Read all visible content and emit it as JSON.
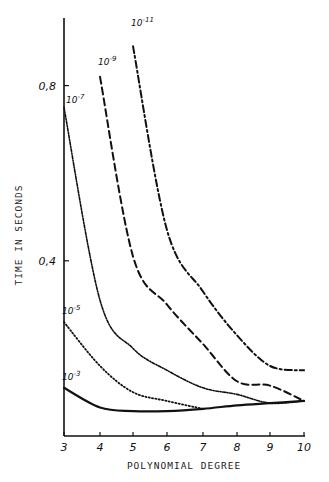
{
  "chart_data": {
    "type": "line",
    "title": "",
    "xlabel": "POLYNOMIAL DEGREE",
    "ylabel": "TIME IN SECONDS",
    "x_ticks": [
      "3",
      "4",
      "5",
      "6",
      "7",
      "8",
      "9",
      "10"
    ],
    "y_ticks": [
      {
        "value": 0.4,
        "label": "0.4"
      },
      {
        "value": 0.8,
        "label": "0.8"
      }
    ],
    "xlim": [
      3,
      10
    ],
    "ylim": [
      0,
      0.95
    ],
    "grid": false,
    "legend": "inline labels at curve starts",
    "series": [
      {
        "name": "10^-3",
        "base": "10",
        "exp": "-3",
        "style": "solid",
        "x": [
          3,
          4,
          5,
          6,
          7,
          8,
          9,
          10
        ],
        "values": [
          0.11,
          0.065,
          0.057,
          0.057,
          0.062,
          0.07,
          0.075,
          0.08
        ]
      },
      {
        "name": "10^-5",
        "base": "10",
        "exp": "-5",
        "style": "dotted",
        "x": [
          3,
          4,
          5,
          6,
          7
        ],
        "values": [
          0.26,
          0.16,
          0.1,
          0.08,
          0.062
        ]
      },
      {
        "name": "10^-7",
        "base": "10",
        "exp": "-7",
        "style": "dash-dot-fine",
        "x": [
          3,
          4,
          5,
          6,
          7,
          8,
          9,
          10
        ],
        "values": [
          0.75,
          0.31,
          0.2,
          0.15,
          0.11,
          0.095,
          0.075,
          0.08
        ]
      },
      {
        "name": "10^-9",
        "base": "10",
        "exp": "-9",
        "style": "dashed",
        "x": [
          4,
          5,
          6,
          7,
          8,
          9,
          10
        ],
        "values": [
          0.82,
          0.41,
          0.3,
          0.21,
          0.125,
          0.115,
          0.08
        ]
      },
      {
        "name": "10^-11",
        "base": "10",
        "exp": "-11",
        "style": "dash-dot",
        "x": [
          5,
          6,
          7,
          8,
          9,
          10
        ],
        "values": [
          0.89,
          0.47,
          0.33,
          0.23,
          0.16,
          0.15
        ]
      }
    ]
  }
}
